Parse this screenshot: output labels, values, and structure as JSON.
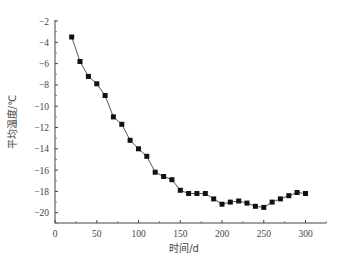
{
  "chart_data": {
    "type": "line",
    "title": "",
    "xlabel": "时间/d",
    "ylabel": "平均温度/℃",
    "xlim": [
      0,
      325
    ],
    "ylim": [
      -21.2,
      -2
    ],
    "xticks": [
      0,
      50,
      100,
      150,
      200,
      250,
      300
    ],
    "yticks": [
      -2,
      -4,
      -6,
      -8,
      -10,
      -12,
      -14,
      -16,
      -18,
      -20
    ],
    "grid": false,
    "legend": null,
    "marker": "square",
    "series": [
      {
        "name": "平均温度",
        "color": "#111111",
        "line_color": "#555555",
        "x": [
          20,
          30,
          40,
          50,
          60,
          70,
          80,
          90,
          100,
          110,
          120,
          130,
          140,
          150,
          160,
          170,
          180,
          190,
          200,
          210,
          220,
          230,
          240,
          250,
          260,
          270,
          280,
          290,
          300
        ],
        "y": [
          -3.5,
          -5.8,
          -7.2,
          -7.9,
          -9.0,
          -11.0,
          -11.7,
          -13.2,
          -14.0,
          -14.7,
          -16.2,
          -16.6,
          -16.9,
          -17.9,
          -18.2,
          -18.2,
          -18.2,
          -18.7,
          -19.2,
          -19.0,
          -18.9,
          -19.1,
          -19.4,
          -19.5,
          -19.0,
          -18.7,
          -18.4,
          -18.1,
          -18.2
        ]
      }
    ]
  }
}
